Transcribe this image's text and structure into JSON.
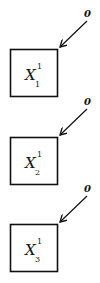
{
  "diagram": {
    "nodes": [
      {
        "id": "x1",
        "symbol": "X",
        "superscript": "1",
        "subscript": "1",
        "input_label": "0"
      },
      {
        "id": "x2",
        "symbol": "X",
        "superscript": "1",
        "subscript": "2",
        "input_label": "0"
      },
      {
        "id": "x3",
        "symbol": "X",
        "superscript": "1",
        "subscript": "3",
        "input_label": "0"
      }
    ],
    "colors": {
      "stroke": "#111111",
      "background": "#ffffff"
    }
  }
}
